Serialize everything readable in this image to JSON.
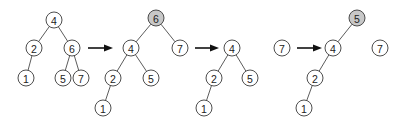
{
  "diagram": {
    "type": "tree-rotation-sequence",
    "node_radius": 8,
    "colors": {
      "node_fill": "#ffffff",
      "shaded_fill": "#c8c8c8",
      "stroke": "#3a3a3a",
      "arrow": "#111111"
    },
    "trees": [
      {
        "id": "tree-1",
        "nodes": [
          {
            "id": "t1n4",
            "label": "4",
            "x": 54,
            "y": 20,
            "shaded": false
          },
          {
            "id": "t1n2",
            "label": "2",
            "x": 34,
            "y": 48,
            "shaded": false
          },
          {
            "id": "t1n6",
            "label": "6",
            "x": 72,
            "y": 48,
            "shaded": false
          },
          {
            "id": "t1n1",
            "label": "1",
            "x": 26,
            "y": 78,
            "shaded": false
          },
          {
            "id": "t1n5",
            "label": "5",
            "x": 63,
            "y": 78,
            "shaded": false
          },
          {
            "id": "t1n7",
            "label": "7",
            "x": 81,
            "y": 78,
            "shaded": false
          }
        ],
        "edges": [
          [
            "t1n4",
            "t1n2"
          ],
          [
            "t1n4",
            "t1n6"
          ],
          [
            "t1n2",
            "t1n1"
          ],
          [
            "t1n6",
            "t1n5"
          ],
          [
            "t1n6",
            "t1n7"
          ]
        ]
      },
      {
        "id": "tree-2",
        "nodes": [
          {
            "id": "t2n6",
            "label": "6",
            "x": 156,
            "y": 18,
            "shaded": true
          },
          {
            "id": "t2n4",
            "label": "4",
            "x": 131,
            "y": 48,
            "shaded": false
          },
          {
            "id": "t2n7",
            "label": "7",
            "x": 180,
            "y": 48,
            "shaded": false
          },
          {
            "id": "t2n2",
            "label": "2",
            "x": 113,
            "y": 78,
            "shaded": false
          },
          {
            "id": "t2n5",
            "label": "5",
            "x": 151,
            "y": 78,
            "shaded": false
          },
          {
            "id": "t2n1",
            "label": "1",
            "x": 103,
            "y": 108,
            "shaded": false
          }
        ],
        "edges": [
          [
            "t2n6",
            "t2n4"
          ],
          [
            "t2n6",
            "t2n7"
          ],
          [
            "t2n4",
            "t2n2"
          ],
          [
            "t2n4",
            "t2n5"
          ],
          [
            "t2n2",
            "t2n1"
          ]
        ]
      },
      {
        "id": "tree-3",
        "nodes": [
          {
            "id": "t3n4",
            "label": "4",
            "x": 232,
            "y": 48,
            "shaded": false
          },
          {
            "id": "t3n2",
            "label": "2",
            "x": 214,
            "y": 78,
            "shaded": false
          },
          {
            "id": "t3n5",
            "label": "5",
            "x": 250,
            "y": 78,
            "shaded": false
          },
          {
            "id": "t3n1",
            "label": "1",
            "x": 204,
            "y": 108,
            "shaded": false
          },
          {
            "id": "t3n7",
            "label": "7",
            "x": 282,
            "y": 48,
            "shaded": false
          }
        ],
        "edges": [
          [
            "t3n4",
            "t3n2"
          ],
          [
            "t3n4",
            "t3n5"
          ],
          [
            "t3n2",
            "t3n1"
          ]
        ]
      },
      {
        "id": "tree-4",
        "nodes": [
          {
            "id": "t4n5",
            "label": "5",
            "x": 357,
            "y": 18,
            "shaded": true
          },
          {
            "id": "t4n4",
            "label": "4",
            "x": 333,
            "y": 48,
            "shaded": false
          },
          {
            "id": "t4n2",
            "label": "2",
            "x": 315,
            "y": 78,
            "shaded": false
          },
          {
            "id": "t4n1",
            "label": "1",
            "x": 304,
            "y": 108,
            "shaded": false
          },
          {
            "id": "t4n7",
            "label": "7",
            "x": 380,
            "y": 48,
            "shaded": false
          }
        ],
        "edges": [
          [
            "t4n5",
            "t4n4"
          ],
          [
            "t4n4",
            "t4n2"
          ],
          [
            "t4n2",
            "t4n1"
          ]
        ]
      }
    ],
    "arrows": [
      {
        "id": "arrow-1",
        "x1": 88,
        "x2": 113,
        "y": 48
      },
      {
        "id": "arrow-2",
        "x1": 195,
        "x2": 219,
        "y": 48
      },
      {
        "id": "arrow-3",
        "x1": 297,
        "x2": 322,
        "y": 48
      }
    ]
  }
}
